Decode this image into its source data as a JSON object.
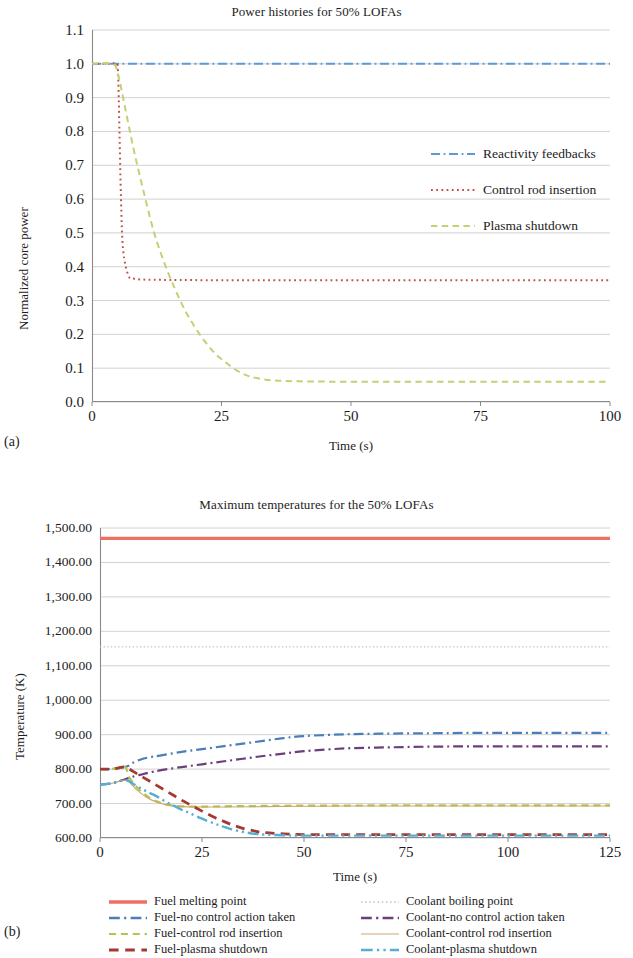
{
  "figure": {
    "panel_a_label": "(a)",
    "panel_b_label": "(b)"
  },
  "chart_data": [
    {
      "id": "power-histories",
      "type": "line",
      "title": "Power histories for 50% LOFAs",
      "xlabel": "Time (s)",
      "ylabel": "Normalized core power",
      "xlim": [
        0,
        100
      ],
      "ylim": [
        0.0,
        1.1
      ],
      "xticks": [
        0,
        25,
        50,
        75,
        100
      ],
      "xtick_labels": [
        "0",
        "25",
        "50",
        "75",
        "100"
      ],
      "yticks": [
        0.0,
        0.1,
        0.2,
        0.3,
        0.4,
        0.5,
        0.6,
        0.7,
        0.8,
        0.9,
        1.0,
        1.1
      ],
      "ytick_labels": [
        "0.0",
        "0.1",
        "0.2",
        "0.3",
        "0.4",
        "0.5",
        "0.6",
        "0.7",
        "0.8",
        "0.9",
        "1.0",
        "1.1"
      ],
      "grid": true,
      "legend_position": "inside-right",
      "series": [
        {
          "name": "Reactivity feedbacks",
          "color": "#5b9bd5",
          "dash": "dash-dot",
          "x": [
            0,
            2,
            4,
            5,
            6,
            8,
            10,
            15,
            20,
            30,
            40,
            50,
            60,
            70,
            80,
            90,
            100
          ],
          "y": [
            1.0,
            1.0,
            1.0,
            1.0,
            1.0,
            1.0,
            1.0,
            1.0,
            1.0,
            1.0,
            1.0,
            1.0,
            1.0,
            1.0,
            1.0,
            1.0,
            1.0
          ]
        },
        {
          "name": "Control rod insertion",
          "color": "#c0504d",
          "dash": "dotted",
          "x": [
            0,
            3,
            4.5,
            5,
            5.3,
            5.6,
            6,
            7,
            8,
            10,
            15,
            25,
            40,
            60,
            80,
            100
          ],
          "y": [
            1.0,
            1.0,
            1.0,
            0.98,
            0.8,
            0.6,
            0.45,
            0.375,
            0.365,
            0.362,
            0.361,
            0.36,
            0.36,
            0.36,
            0.36,
            0.36
          ]
        },
        {
          "name": "Plasma shutdown",
          "color": "#c3d175",
          "dash": "dashed",
          "x": [
            0,
            4,
            5,
            6,
            8,
            10,
            12,
            14,
            16,
            18,
            20,
            22,
            24,
            26,
            28,
            30,
            32,
            35,
            40,
            50,
            60,
            70,
            80,
            90,
            100
          ],
          "y": [
            1.0,
            1.0,
            0.97,
            0.9,
            0.75,
            0.62,
            0.5,
            0.41,
            0.335,
            0.27,
            0.218,
            0.175,
            0.14,
            0.115,
            0.093,
            0.078,
            0.07,
            0.064,
            0.061,
            0.06,
            0.06,
            0.06,
            0.06,
            0.06,
            0.06
          ]
        }
      ]
    },
    {
      "id": "maximum-temperatures",
      "type": "line",
      "title": "Maximum temperatures for the 50% LOFAs",
      "xlabel": "Time (s)",
      "ylabel": "Temperature (K)",
      "xlim": [
        0,
        125
      ],
      "ylim": [
        600,
        1500
      ],
      "xticks": [
        0,
        25,
        50,
        75,
        100,
        125
      ],
      "xtick_labels": [
        "0",
        "25",
        "50",
        "75",
        "100",
        "125"
      ],
      "yticks": [
        600,
        700,
        800,
        900,
        1000,
        1100,
        1200,
        1300,
        1400,
        1500
      ],
      "ytick_labels": [
        "600.00",
        "700.00",
        "800.00",
        "900.00",
        "1,000.00",
        "1,100.00",
        "1,200.00",
        "1,300.00",
        "1,400.00",
        "1,500.00"
      ],
      "grid": true,
      "legend_position": "below",
      "series": [
        {
          "name": "Fuel melting point",
          "color": "#ef6f63",
          "dash": "solid",
          "width": 3.2,
          "x": [
            0,
            125
          ],
          "y": [
            1470,
            1470
          ]
        },
        {
          "name": "Coolant boiling point",
          "color": "#b9bfc9",
          "dash": "dotted",
          "width": 1.4,
          "x": [
            0,
            125
          ],
          "y": [
            1155,
            1155
          ]
        },
        {
          "name": "Fuel-no control action taken",
          "color": "#4a7ebb",
          "dash": "dash-dot",
          "width": 2.2,
          "x": [
            0,
            2,
            4,
            5,
            6,
            7,
            8,
            10,
            12,
            15,
            20,
            25,
            30,
            35,
            40,
            45,
            50,
            60,
            70,
            80,
            90,
            100,
            110,
            120,
            125
          ],
          "y": [
            800,
            800,
            802,
            805,
            806,
            810,
            818,
            828,
            834,
            840,
            850,
            858,
            866,
            874,
            882,
            890,
            896,
            901,
            903,
            904,
            905,
            905,
            905,
            905,
            905
          ]
        },
        {
          "name": "Coolant-no control action taken",
          "color": "#6a3f7a",
          "dash": "dash-dot",
          "width": 2.2,
          "x": [
            0,
            2,
            4,
            5,
            6,
            7,
            8,
            10,
            12,
            15,
            20,
            25,
            30,
            35,
            40,
            45,
            50,
            60,
            70,
            80,
            90,
            100,
            110,
            120,
            125
          ],
          "y": [
            755,
            757,
            762,
            766,
            770,
            774,
            778,
            784,
            790,
            797,
            806,
            814,
            822,
            830,
            838,
            845,
            852,
            860,
            863,
            865,
            866,
            866,
            866,
            866,
            866
          ]
        },
        {
          "name": "Fuel-control rod insertion",
          "color": "#b5c352",
          "dash": "dashed",
          "width": 2.2,
          "x": [
            0,
            2,
            4,
            5,
            6,
            6.5,
            7,
            8,
            9,
            10,
            12,
            14,
            16,
            18,
            20,
            25,
            30,
            40,
            50,
            60,
            70,
            80,
            90,
            100,
            110,
            120,
            125
          ],
          "y": [
            800,
            800,
            802,
            805,
            807,
            800,
            780,
            762,
            748,
            736,
            718,
            706,
            698,
            694,
            692,
            691,
            692,
            693,
            694,
            694,
            695,
            695,
            695,
            695,
            695,
            695,
            695
          ]
        },
        {
          "name": "Coolant-control rod insertion",
          "color": "#c9a96a",
          "dash": "solid",
          "width": 1.1,
          "x": [
            0,
            2,
            4,
            5,
            6,
            7,
            8,
            9,
            10,
            12,
            14,
            16,
            18,
            20,
            25,
            30,
            40,
            50,
            60,
            70,
            80,
            90,
            100,
            110,
            120,
            125
          ],
          "y": [
            755,
            757,
            762,
            766,
            768,
            764,
            752,
            740,
            730,
            714,
            704,
            697,
            693,
            691,
            690,
            690,
            691,
            692,
            693,
            693,
            693,
            693,
            693,
            693,
            693,
            693
          ]
        },
        {
          "name": "Fuel-plasma shutdown",
          "color": "#a33a32",
          "dash": "dashed",
          "width": 2.8,
          "x": [
            0,
            2,
            4,
            5,
            6,
            7,
            8,
            10,
            12,
            14,
            16,
            18,
            20,
            22,
            25,
            28,
            30,
            32,
            35,
            38,
            40,
            45,
            50,
            60,
            70,
            80,
            90,
            100,
            110,
            120,
            125
          ],
          "y": [
            800,
            800,
            802,
            805,
            806,
            802,
            794,
            780,
            766,
            752,
            738,
            724,
            710,
            697,
            678,
            660,
            650,
            640,
            628,
            620,
            616,
            612,
            610,
            610,
            610,
            610,
            610,
            610,
            610,
            610,
            610
          ]
        },
        {
          "name": "Coolant-plasma shutdown",
          "color": "#57aed4",
          "dash": "dash-dot-dot",
          "width": 2.4,
          "x": [
            0,
            2,
            4,
            5,
            6,
            7,
            8,
            10,
            12,
            14,
            16,
            18,
            20,
            22,
            25,
            28,
            30,
            32,
            35,
            38,
            40,
            45,
            50,
            60,
            70,
            80,
            90,
            100,
            110,
            120,
            125
          ],
          "y": [
            755,
            757,
            762,
            766,
            768,
            766,
            758,
            744,
            732,
            720,
            706,
            694,
            682,
            672,
            656,
            642,
            634,
            626,
            618,
            612,
            610,
            608,
            607,
            607,
            607,
            607,
            607,
            607,
            607,
            607,
            607
          ]
        }
      ]
    }
  ],
  "legend_a": [
    {
      "label": "Reactivity feedbacks",
      "color": "#5b9bd5",
      "dash": "dash-dot"
    },
    {
      "label": "Control rod insertion",
      "color": "#c0504d",
      "dash": "dotted"
    },
    {
      "label": "Plasma shutdown",
      "color": "#c3d175",
      "dash": "dashed"
    }
  ],
  "legend_b": [
    {
      "label": "Fuel melting point",
      "color": "#ef6f63",
      "dash": "solid",
      "width": 3.4
    },
    {
      "label": "Coolant boiling point",
      "color": "#b9bfc9",
      "dash": "dotted",
      "width": 1.6
    },
    {
      "label": "Fuel-no control action taken",
      "color": "#4a7ebb",
      "dash": "dash-dot",
      "width": 2.4
    },
    {
      "label": "Coolant-no control action taken",
      "color": "#6a3f7a",
      "dash": "dash-dot",
      "width": 2.4
    },
    {
      "label": "Fuel-control rod insertion",
      "color": "#b5c352",
      "dash": "dashed",
      "width": 2.2
    },
    {
      "label": "Coolant-control rod insertion",
      "color": "#c9a96a",
      "dash": "solid",
      "width": 1.1
    },
    {
      "label": "Fuel-plasma shutdown",
      "color": "#a33a32",
      "dash": "dashed",
      "width": 3.0
    },
    {
      "label": "Coolant-plasma shutdown",
      "color": "#57aed4",
      "dash": "dash-dot-dot",
      "width": 2.6
    }
  ]
}
